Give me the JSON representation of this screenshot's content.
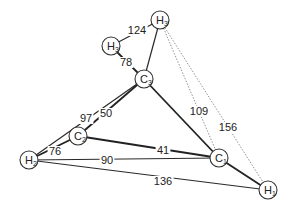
{
  "diagram": {
    "title": "",
    "nodes": [
      {
        "id": "H3p",
        "base": "H",
        "sub": "3",
        "prime": "'",
        "x": 160,
        "y": 20
      },
      {
        "id": "H3",
        "base": "H",
        "sub": "3",
        "prime": "",
        "x": 111,
        "y": 46
      },
      {
        "id": "C3",
        "base": "C",
        "sub": "3",
        "prime": "",
        "x": 144,
        "y": 79
      },
      {
        "id": "C2",
        "base": "C",
        "sub": "2",
        "prime": "",
        "x": 78,
        "y": 136
      },
      {
        "id": "H2",
        "base": "H",
        "sub": "2",
        "prime": "",
        "x": 29,
        "y": 160
      },
      {
        "id": "C1",
        "base": "C",
        "sub": "1",
        "prime": "",
        "x": 219,
        "y": 158
      },
      {
        "id": "H1",
        "base": "H",
        "sub": "1",
        "prime": "",
        "x": 268,
        "y": 190
      }
    ],
    "edges": [
      {
        "from": "H3",
        "to": "C3",
        "style": "bold",
        "label": "78",
        "lx": 126,
        "ly": 66
      },
      {
        "from": "H3",
        "to": "H3p",
        "style": "thin",
        "label": "124",
        "lx": 137,
        "ly": 34
      },
      {
        "from": "H3p",
        "to": "C3",
        "style": "thin",
        "label": "",
        "lx": 0,
        "ly": 0
      },
      {
        "from": "C3",
        "to": "C2",
        "style": "bold",
        "label": "50",
        "lx": 106,
        "ly": 117
      },
      {
        "from": "C3",
        "to": "H2",
        "style": "thin",
        "label": "97",
        "lx": 86,
        "ly": 122
      },
      {
        "from": "C3",
        "to": "C1",
        "style": "bold",
        "label": "109",
        "lx": 199,
        "ly": 115
      },
      {
        "from": "H3p",
        "to": "C1",
        "style": "dotted",
        "label": "",
        "lx": 0,
        "ly": 0
      },
      {
        "from": "H3p",
        "to": "H1",
        "style": "dotted",
        "label": "156",
        "lx": 228,
        "ly": 131
      },
      {
        "from": "C2",
        "to": "H2",
        "style": "bold",
        "label": "76",
        "lx": 55,
        "ly": 155
      },
      {
        "from": "C2",
        "to": "C1",
        "style": "bold",
        "label": "41",
        "lx": 163,
        "ly": 154
      },
      {
        "from": "H2",
        "to": "C1",
        "style": "thin",
        "label": "90",
        "lx": 107,
        "ly": 164
      },
      {
        "from": "H2",
        "to": "H1",
        "style": "thin",
        "label": "136",
        "lx": 163,
        "ly": 185
      },
      {
        "from": "C1",
        "to": "H1",
        "style": "bold",
        "label": "",
        "lx": 0,
        "ly": 0
      }
    ],
    "node_radius": 9
  }
}
